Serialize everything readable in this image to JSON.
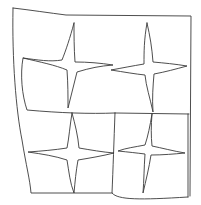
{
  "drawing": {
    "title": "Quilt sketch with four-pointed stars",
    "stroke_color": "#3a3a3a",
    "background": "#ffffff",
    "panels": [
      {
        "name": "outer-frame",
        "d": "M13,8 C30,10 50,13 66,15 L191,16 L190,196 M13,8 C12,60 16,110 22,140 C26,165 30,180 31,193 L112,193"
      },
      {
        "name": "top-left-block",
        "d": "M23,58 C20,75 22,95 27,110 C60,113 90,114 115,113"
      },
      {
        "name": "middle-divider",
        "d": "M115,113 L189,114"
      },
      {
        "name": "bottom-right-block",
        "d": "M115,113 C114,140 113,170 112,193 C118,200 140,200 188,197"
      },
      {
        "name": "bottom-right-inner-edge",
        "d": "M188,114 L188,197"
      }
    ],
    "stars": [
      {
        "name": "star-top-left",
        "d": "M74,23 C70,38 66,50 62,60 C50,62 38,60 23,58 C40,62 55,65 67,70 C68,84 68,96 68,108 C71,96 74,84 77,72 C90,68 100,66 113,65 C100,63 88,62 75,62 C74,48 74,35 74,23 Z"
      },
      {
        "name": "star-top-right",
        "d": "M147,23 C144,40 144,52 144,64 C132,66 122,68 111,70 C124,72 135,74 145,75 C146,86 150,98 153,112 C152,98 153,86 154,74 C165,72 176,69 187,66 C175,64 164,63 153,62 C152,48 150,36 147,23 Z"
      },
      {
        "name": "star-bottom-left",
        "d": "M72,113 C70,125 69,138 67,148 C54,150 42,151 28,152 C42,154 55,156 67,160 C69,172 70,183 74,193 C75,182 76,171 78,160 C90,158 102,156 114,153 C102,152 91,150 79,148 C78,136 75,124 72,113 Z"
      },
      {
        "name": "star-bottom-right",
        "d": "M152,114 C150,126 148,136 145,145 C135,147 126,148 118,151 C128,152 137,153 145,154 C144,168 144,180 143,193 C146,180 149,168 151,155 C163,155 174,154 185,153 C173,151 162,148 152,146 C151,136 151,126 152,114 Z"
      }
    ]
  }
}
